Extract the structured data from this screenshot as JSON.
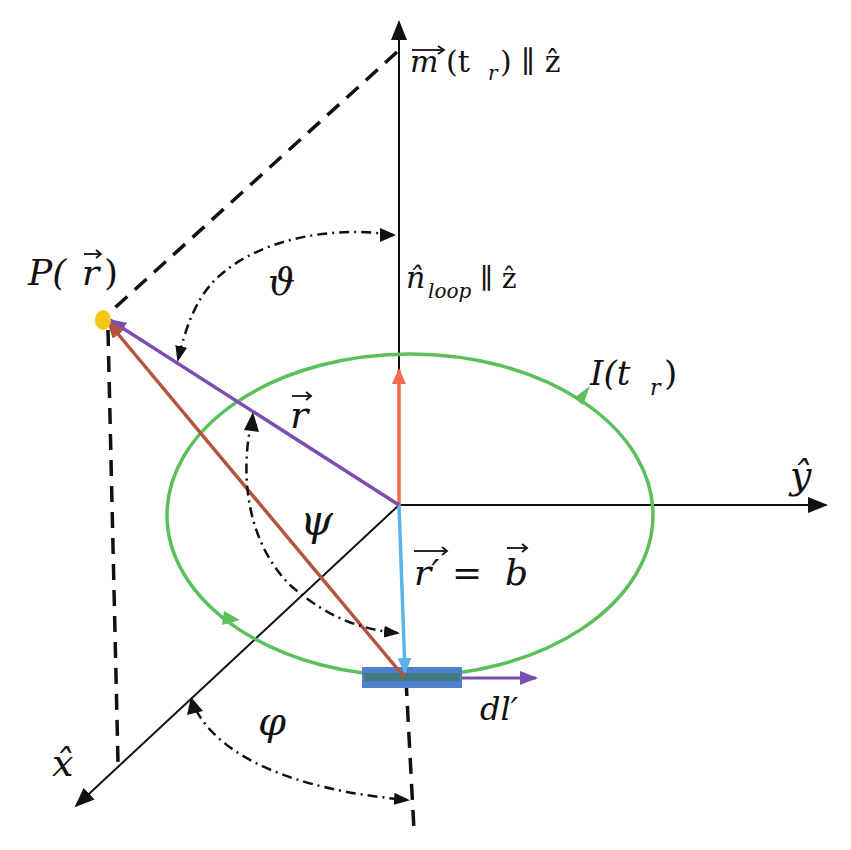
{
  "figure": {
    "labels": {
      "m_vector": "m⃗(tᵣ) ∥ ẑ",
      "m_main": "m",
      "m_arg": "(t",
      "m_sub": "r",
      "m_close": ") ∥ ẑ",
      "n_loop_main": "n̂",
      "n_loop_sub": "loop",
      "n_loop_rest": " ∥ ẑ",
      "point_P": "P(",
      "point_P_r": "r",
      "point_P_close": ")",
      "theta": "ϑ",
      "current_main": "I(t",
      "current_sub": "r",
      "current_close": ")",
      "r_vector": "r",
      "psi": "ψ",
      "r_prime_main": "r′",
      "r_prime_eq": " = ",
      "b_vector": "b",
      "dl_prime": "dl′",
      "y_axis": "ŷ",
      "x_axis": "x̂",
      "phi": "φ"
    },
    "colors": {
      "axis": "#111111",
      "loop": "#5cc05a",
      "r_vector": "#7b4fb0",
      "R_vector": "#b5543e",
      "r_prime": "#5ab4ea",
      "n_loop": "#f26b4a",
      "point": "#f5c518",
      "element": "#4f7fcf",
      "element_inner": "#3d7a6e",
      "dl_arrow": "#7b4fb0"
    }
  }
}
